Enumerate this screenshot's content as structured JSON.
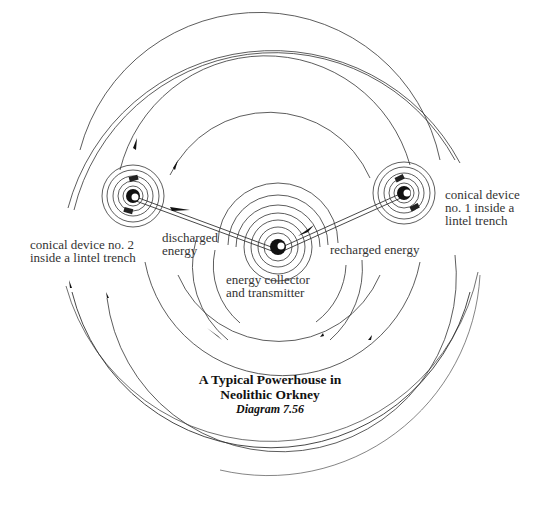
{
  "title": {
    "line1": "A Typical Powerhouse in",
    "line2": "Neolithic Orkney",
    "caption": "Diagram 7.56"
  },
  "labels": {
    "device1": [
      "conical device",
      "no. 1 inside a",
      "lintel trench"
    ],
    "device2": [
      "conical device no. 2",
      "inside a lintel trench"
    ],
    "discharged": [
      "discharged",
      "energy"
    ],
    "recharged": "recharged energy",
    "collector": [
      "energy collector",
      "and transmitter"
    ]
  },
  "nodes": {
    "center": {
      "name": "energy collector and transmitter",
      "x": 278,
      "y": 247
    },
    "device1": {
      "name": "conical device no. 1",
      "x": 404,
      "y": 193
    },
    "device2": {
      "name": "conical device no. 2",
      "x": 133,
      "y": 196
    }
  },
  "connections": [
    {
      "from": "device2",
      "to": "center",
      "label": "discharged energy"
    },
    {
      "from": "center",
      "to": "device1",
      "label": "recharged energy"
    }
  ],
  "colors": {
    "ink": "#222222",
    "background": "#ffffff"
  }
}
